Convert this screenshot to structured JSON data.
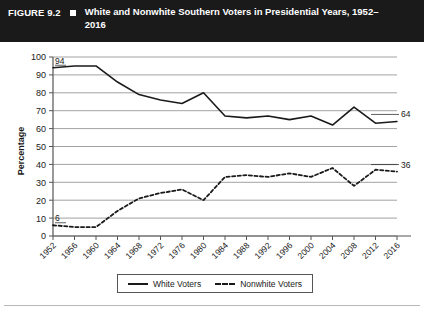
{
  "header": {
    "figure_number": "FIGURE 9.2",
    "marker_icon": "filled-square-icon",
    "title": "White and Nonwhite Southern Voters in Presidential Years, 1952–2016"
  },
  "legend": {
    "white_label": "White Voters",
    "nonwhite_label": "Nonwhite Voters"
  },
  "colors": {
    "header_background": "#1a1a1a",
    "header_text": "#ffffff",
    "line": "#1a1a1a",
    "gridline": "#8a8a8a",
    "axis": "#555555",
    "plot_background": "#ffffff"
  },
  "chart_data": {
    "type": "line",
    "title": "White and Nonwhite Southern Voters in Presidential Years, 1952–2016",
    "xlabel": "",
    "ylabel": "Percentage",
    "ylim": [
      0,
      100
    ],
    "ytick_step": 10,
    "yticks": [
      0,
      10,
      20,
      30,
      40,
      50,
      60,
      70,
      80,
      90,
      100
    ],
    "grid": true,
    "legend_position": "bottom-center",
    "categories": [
      "1952",
      "1956",
      "1960",
      "1964",
      "1968",
      "1972",
      "1976",
      "1980",
      "1984",
      "1988",
      "1992",
      "1996",
      "2000",
      "2004",
      "2008",
      "2012",
      "2016"
    ],
    "series": [
      {
        "name": "White Voters",
        "style": "solid",
        "values": [
          94,
          95,
          95,
          86,
          79,
          76,
          74,
          80,
          67,
          66,
          67,
          65,
          67,
          62,
          72,
          63,
          64
        ],
        "endpoint_labels": {
          "start": "94",
          "end": "64"
        }
      },
      {
        "name": "Nonwhite Voters",
        "style": "dashed",
        "values": [
          6,
          5,
          5,
          14,
          21,
          24,
          26,
          20,
          33,
          34,
          33,
          35,
          33,
          38,
          28,
          37,
          36
        ],
        "endpoint_labels": {
          "start": "6",
          "end": "36"
        }
      }
    ]
  }
}
